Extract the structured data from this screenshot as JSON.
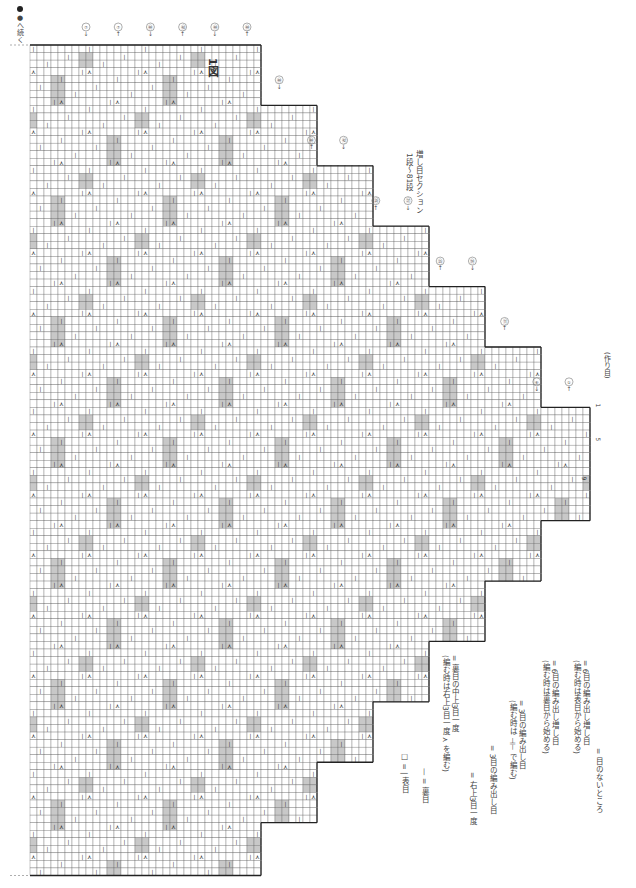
{
  "figure": {
    "title": "1図",
    "section_label": "増し目セクション",
    "rows_label": "1段～81段",
    "continue_note": "●へ続く",
    "cast_on_label": "(作り目)"
  },
  "row_markers": {
    "top_left": [
      "⑧",
      "⑧",
      "①",
      "⑧",
      "⑧"
    ],
    "steps": [
      "⑦",
      "⑦",
      "㊾",
      "㊽",
      "㊾",
      "㊾",
      "㊾",
      "㊾",
      "㊷",
      "㉟",
      "㉗",
      "㉕",
      "⑲",
      "⑪",
      "⑥",
      "①"
    ]
  },
  "stitch_numbers": [
    "1",
    "5",
    "9"
  ],
  "legend": [
    {
      "symbol": "□",
      "text": "□ = | 表目"
    },
    {
      "symbol": "—",
      "text": "— = 裏目"
    },
    {
      "symbol": "⋏",
      "text": "= 裏目の中上3目一度",
      "sub": "(編む時は右上3目一度 ⋏ を編む)"
    },
    {
      "symbol": "⋏",
      "text": "= 右上3目一度"
    },
    {
      "symbol": "⊣⊢",
      "text": "= 3目の編み出し目"
    },
    {
      "symbol": "⊣⊢",
      "text": "= 3目の編み出し目",
      "sub": "(編む時は ⊣⊢ で編む)"
    },
    {
      "symbol": "⊣⊢⊣⊢",
      "text": "= 6目の編み出し増し目",
      "sub": "(編む時は裏目から始める)"
    },
    {
      "symbol": "⊣⊢⊣⊢",
      "text": "= 6目の編み出し増し目",
      "sub": "(編む時は表目から始める)"
    },
    {
      "symbol": "■",
      "text": "= 目のないところ"
    }
  ],
  "colors": {
    "grid_line": "#666666",
    "border": "#222222",
    "no_stitch_grey": "#c8c8c8",
    "text": "#444444"
  }
}
